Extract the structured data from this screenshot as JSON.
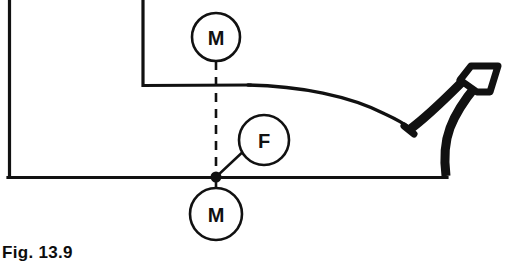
{
  "figure": {
    "caption": "Fig. 13.9",
    "background_color": "#ffffff",
    "ink_color": "#111111",
    "annotations": {
      "top_moment": "M",
      "bottom_moment": "M",
      "force": "F"
    },
    "labels": [
      {
        "id": "moment-top",
        "text": "M",
        "cx": 216,
        "cy": 37,
        "r": 24
      },
      {
        "id": "force",
        "text": "F",
        "cx": 264,
        "cy": 140,
        "r": 25
      },
      {
        "id": "moment-bottom",
        "text": "M",
        "cx": 216,
        "cy": 214,
        "r": 26
      }
    ],
    "geometry": {
      "baseline_y": 177,
      "baseline_x_start": 8,
      "baseline_x_end": 447,
      "junction_x": 216,
      "junction_y": 177,
      "left_wall_x": 8,
      "inner_wall_x": 142,
      "inner_shelf_y": 85,
      "pedal_heel_x": 410,
      "pedal_heel_y": 128
    }
  }
}
